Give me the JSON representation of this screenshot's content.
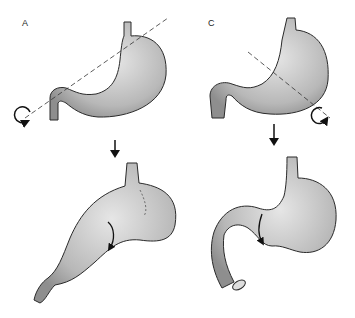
{
  "figure": {
    "panels": [
      {
        "label": "A",
        "description": "stomach with organoaxial rotation axis (dashed line) and rotation arrow at pylorus"
      },
      {
        "label": "C",
        "description": "stomach with mesenteroaxial rotation axis (dashed line) and rotation arrow"
      }
    ],
    "colors": {
      "fill": "#b9b9b9",
      "fill_light": "#d8d8d8",
      "stroke": "#2a2a2a",
      "background": "#ffffff"
    }
  }
}
